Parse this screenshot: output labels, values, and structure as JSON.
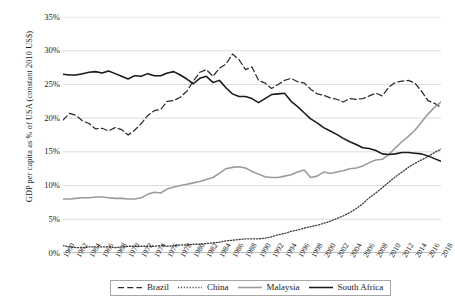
{
  "chart_data": {
    "type": "line",
    "title": "",
    "xlabel": "",
    "ylabel": "GDP per capita as % of USA (constant 2010 US$)",
    "ylim": [
      0,
      35
    ],
    "ytick_labels": [
      "0%",
      "5%",
      "10%",
      "15%",
      "20%",
      "25%",
      "30%",
      "35%"
    ],
    "ytick_values": [
      0,
      5,
      10,
      15,
      20,
      25,
      30,
      35
    ],
    "grid": true,
    "legend_position": "bottom",
    "x_range": [
      1960,
      2018
    ],
    "xtick_labels": [
      "1960",
      "1962",
      "1964",
      "1966",
      "1968",
      "1970",
      "1972",
      "1974",
      "1976",
      "1978",
      "1980",
      "1982",
      "1984",
      "1986",
      "1988",
      "1990",
      "1992",
      "1994",
      "1996",
      "1998",
      "2000",
      "2002",
      "2004",
      "2006",
      "2008",
      "2010",
      "2012",
      "2014",
      "2016",
      "2018"
    ],
    "x": [
      1960,
      1961,
      1962,
      1963,
      1964,
      1965,
      1966,
      1967,
      1968,
      1969,
      1970,
      1971,
      1972,
      1973,
      1974,
      1975,
      1976,
      1977,
      1978,
      1979,
      1980,
      1981,
      1982,
      1983,
      1984,
      1985,
      1986,
      1987,
      1988,
      1989,
      1990,
      1991,
      1992,
      1993,
      1994,
      1995,
      1996,
      1997,
      1998,
      1999,
      2000,
      2001,
      2002,
      2003,
      2004,
      2005,
      2006,
      2007,
      2008,
      2009,
      2010,
      2011,
      2012,
      2013,
      2014,
      2015,
      2016,
      2017,
      2018
    ],
    "series": [
      {
        "name": "Brazil",
        "style": "dashed",
        "color": "#2b2b2b",
        "values": [
          19.7,
          20.7,
          20.4,
          19.6,
          19.2,
          18.4,
          18.5,
          18.1,
          18.6,
          18.3,
          17.5,
          18.2,
          19.2,
          20.4,
          21.1,
          21.3,
          22.5,
          22.6,
          23.1,
          24.0,
          25.5,
          26.8,
          27.2,
          26.2,
          27.4,
          28.0,
          29.5,
          28.7,
          27.2,
          27.6,
          25.6,
          25.2,
          24.4,
          25.0,
          25.6,
          25.9,
          25.4,
          25.2,
          24.3,
          23.6,
          23.4,
          23.0,
          22.8,
          22.4,
          22.9,
          22.8,
          22.9,
          23.3,
          23.7,
          23.3,
          24.6,
          25.3,
          25.5,
          25.6,
          25.2,
          24.0,
          22.6,
          22.2,
          21.6
        ]
      },
      {
        "name": "China",
        "style": "dotted",
        "color": "#3a3a3a",
        "values": [
          1.1,
          0.9,
          0.8,
          0.8,
          0.9,
          0.9,
          0.9,
          0.9,
          0.8,
          0.9,
          1.0,
          1.0,
          1.0,
          1.0,
          1.0,
          1.1,
          1.0,
          1.1,
          1.2,
          1.2,
          1.3,
          1.3,
          1.4,
          1.5,
          1.6,
          1.8,
          1.9,
          2.0,
          2.1,
          2.1,
          2.1,
          2.2,
          2.4,
          2.7,
          2.9,
          3.2,
          3.4,
          3.7,
          3.9,
          4.1,
          4.4,
          4.7,
          5.1,
          5.5,
          6.0,
          6.6,
          7.3,
          8.2,
          8.9,
          9.7,
          10.5,
          11.3,
          12.0,
          12.7,
          13.3,
          13.8,
          14.3,
          14.9,
          15.4
        ]
      },
      {
        "name": "Malaysia",
        "style": "solid",
        "color": "#9a9a9a",
        "values": [
          8.0,
          8.0,
          8.1,
          8.2,
          8.2,
          8.3,
          8.3,
          8.2,
          8.1,
          8.1,
          8.0,
          8.0,
          8.2,
          8.7,
          9.0,
          8.9,
          9.5,
          9.8,
          10.0,
          10.2,
          10.4,
          10.6,
          10.9,
          11.2,
          11.8,
          12.5,
          12.7,
          12.8,
          12.6,
          12.1,
          11.7,
          11.3,
          11.2,
          11.2,
          11.4,
          11.6,
          12.0,
          12.3,
          11.2,
          11.4,
          12.0,
          11.8,
          12.0,
          12.2,
          12.5,
          12.6,
          12.9,
          13.4,
          13.8,
          13.9,
          14.6,
          15.6,
          16.5,
          17.3,
          18.2,
          19.4,
          20.6,
          21.6,
          22.4
        ]
      },
      {
        "name": "South Africa",
        "style": "solid",
        "color": "#1a1a1a",
        "values": [
          26.5,
          26.4,
          26.4,
          26.6,
          26.8,
          26.9,
          26.7,
          27.0,
          26.6,
          26.2,
          25.8,
          26.3,
          26.2,
          26.6,
          26.3,
          26.3,
          26.7,
          26.9,
          26.4,
          25.8,
          25.1,
          25.9,
          26.2,
          25.3,
          25.6,
          24.5,
          23.6,
          23.2,
          23.2,
          22.9,
          22.3,
          22.9,
          23.5,
          23.6,
          23.7,
          22.5,
          21.7,
          20.8,
          19.9,
          19.3,
          18.6,
          18.1,
          17.6,
          17.0,
          16.5,
          16.1,
          15.6,
          15.5,
          15.2,
          14.7,
          14.6,
          14.7,
          14.9,
          14.9,
          14.8,
          14.7,
          14.4,
          14.0,
          13.6
        ]
      }
    ]
  },
  "legend": {
    "items": [
      {
        "label": "Brazil"
      },
      {
        "label": "China"
      },
      {
        "label": "Malaysia"
      },
      {
        "label": "South Africa"
      }
    ]
  }
}
